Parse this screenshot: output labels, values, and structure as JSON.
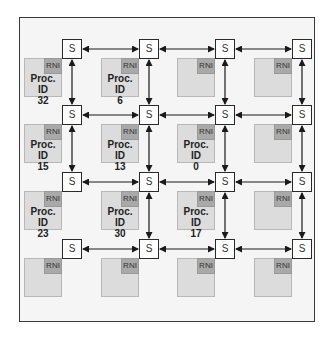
{
  "diagram": {
    "type": "4x4 mesh network-on-chip",
    "switch_label": "S",
    "rni_label": "RNI",
    "proc_prefix": "Proc. ID",
    "colors": {
      "frame_bg": "#f5f5f5",
      "frame_border": "#3a3a3a",
      "pe_fill": "#dcdcdc",
      "rni_fill": "#a9a9a9",
      "switch_fill": "#ffffff",
      "link": "#1a1a1a"
    },
    "nodes": [
      [
        {
          "proc_id": "32"
        },
        {
          "proc_id": "6"
        },
        {
          "proc_id": null
        },
        {
          "proc_id": null
        }
      ],
      [
        {
          "proc_id": "15"
        },
        {
          "proc_id": "13"
        },
        {
          "proc_id": "0"
        },
        {
          "proc_id": null
        }
      ],
      [
        {
          "proc_id": "23"
        },
        {
          "proc_id": "30"
        },
        {
          "proc_id": "17"
        },
        {
          "proc_id": null
        }
      ],
      [
        {
          "proc_id": null
        },
        {
          "proc_id": null
        },
        {
          "proc_id": null
        },
        {
          "proc_id": null
        }
      ]
    ],
    "links": {
      "horizontal": "all adjacent switches in each row, bidirectional",
      "vertical": "all adjacent switches in each column, bidirectional, except column 0 between row 2 and row 3"
    }
  }
}
